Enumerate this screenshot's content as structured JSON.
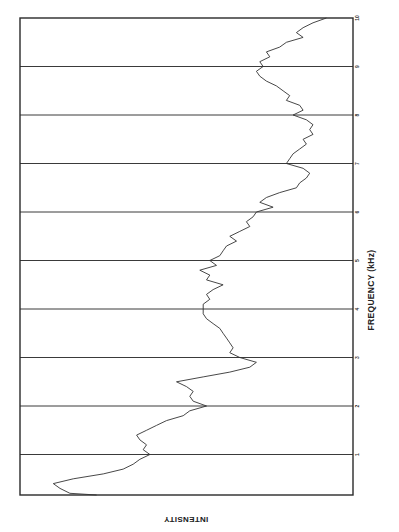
{
  "chart_data": {
    "type": "line",
    "orientation": "rotated-90",
    "title": "",
    "xlabel": "FREQUENCY (kHz)",
    "ylabel": "INTENSITY",
    "x_ticks": [
      "1",
      "2",
      "3",
      "4",
      "5",
      "6",
      "7",
      "8",
      "9",
      "10"
    ],
    "xlim": [
      0.2,
      10
    ],
    "grid": "vertical lines at each kHz",
    "legend": "none",
    "series": [
      {
        "name": "spectrum",
        "note": "intensity in relative units (0 = baseline left edge of frame, 100 = right edge)",
        "x": [
          10.0,
          9.9,
          9.8,
          9.7,
          9.6,
          9.5,
          9.4,
          9.3,
          9.2,
          9.1,
          9.0,
          8.9,
          8.8,
          8.7,
          8.6,
          8.5,
          8.4,
          8.3,
          8.2,
          8.1,
          8.0,
          7.9,
          7.8,
          7.7,
          7.6,
          7.5,
          7.4,
          7.3,
          7.2,
          7.1,
          7.0,
          6.9,
          6.8,
          6.7,
          6.6,
          6.5,
          6.4,
          6.3,
          6.2,
          6.1,
          6.0,
          5.9,
          5.8,
          5.7,
          5.6,
          5.5,
          5.4,
          5.3,
          5.2,
          5.1,
          5.0,
          4.9,
          4.8,
          4.7,
          4.6,
          4.5,
          4.4,
          4.3,
          4.2,
          4.1,
          4.0,
          3.9,
          3.8,
          3.7,
          3.6,
          3.5,
          3.4,
          3.3,
          3.2,
          3.1,
          3.0,
          2.9,
          2.8,
          2.7,
          2.6,
          2.5,
          2.4,
          2.3,
          2.2,
          2.1,
          2.0,
          1.9,
          1.8,
          1.7,
          1.6,
          1.5,
          1.4,
          1.3,
          1.2,
          1.1,
          1.0,
          0.9,
          0.8,
          0.7,
          0.6,
          0.5,
          0.4,
          0.3,
          0.2
        ],
        "values": [
          92,
          88,
          85,
          83,
          85,
          80,
          78,
          74,
          75,
          72,
          73,
          71,
          72,
          74,
          77,
          79,
          81,
          80,
          84,
          85,
          82,
          86,
          88,
          87,
          88,
          85,
          86,
          84,
          82,
          81,
          80,
          85,
          87,
          86,
          84,
          83,
          78,
          74,
          72,
          76,
          71,
          70,
          68,
          69,
          66,
          63,
          65,
          62,
          61,
          60,
          57,
          59,
          54,
          57,
          56,
          61,
          58,
          56,
          57,
          55,
          55,
          55,
          56,
          58,
          60,
          61,
          62,
          63,
          64,
          63,
          66,
          71,
          69,
          63,
          55,
          47,
          50,
          52,
          51,
          52,
          56,
          51,
          49,
          44,
          41,
          38,
          35,
          36,
          38,
          37,
          39,
          36,
          34,
          31,
          25,
          16,
          10,
          12,
          15
        ]
      }
    ]
  },
  "labels": {
    "xlabel": "FREQUENCY (kHz)",
    "ylabel": "INTENSITY",
    "ticks": [
      "1",
      "2",
      "3",
      "4",
      "5",
      "6",
      "7",
      "8",
      "9",
      "10"
    ]
  }
}
